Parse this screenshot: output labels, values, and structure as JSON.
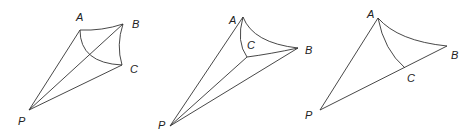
{
  "figures": [
    {
      "id": "figure-1",
      "labels": {
        "A": "A",
        "B": "B",
        "C": "C",
        "P": "P"
      },
      "points": {
        "A": [
          80,
          30
        ],
        "B": [
          123,
          24
        ],
        "C": [
          122,
          65
        ],
        "P": [
          29,
          110
        ],
        "X": [
          89,
          55
        ]
      },
      "label_pos": {
        "A": [
          76,
          22
        ],
        "B": [
          132,
          28
        ],
        "C": [
          130,
          73
        ],
        "P": [
          18,
          125
        ]
      }
    },
    {
      "id": "figure-2",
      "labels": {
        "A": "A",
        "B": "B",
        "C": "C",
        "P": "P"
      },
      "points": {
        "A": [
          243,
          17
        ],
        "B": [
          298,
          48
        ],
        "C": [
          247,
          57
        ],
        "P": [
          170,
          126
        ]
      },
      "label_pos": {
        "A": [
          229,
          24
        ],
        "B": [
          305,
          53
        ],
        "C": [
          247,
          47
        ],
        "P": [
          158,
          129
        ]
      }
    },
    {
      "id": "figure-3",
      "labels": {
        "A": "A",
        "B": "B",
        "C": "C",
        "P": "P"
      },
      "points": {
        "A": [
          378,
          18
        ],
        "B": [
          447,
          46
        ],
        "C": [
          405,
          68
        ],
        "P": [
          320,
          110
        ]
      },
      "label_pos": {
        "A": [
          367,
          18
        ],
        "B": [
          451,
          59
        ],
        "C": [
          407,
          82
        ],
        "P": [
          305,
          119
        ]
      }
    }
  ]
}
